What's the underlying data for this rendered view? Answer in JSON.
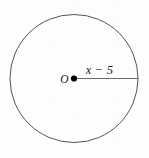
{
  "figure": {
    "kind": "geometry-diagram",
    "background_color": "#fdfdfd",
    "stroke_color": "#555555",
    "text_color": "#1b1b1b",
    "dot_color": "#000000",
    "canvas": {
      "width": 149,
      "height": 158
    },
    "circle": {
      "center_x": 74,
      "center_y": 78.5,
      "radius": 64,
      "stroke_width": 1
    },
    "center_point": {
      "label": "O",
      "x": 74,
      "y": 78.5,
      "dot_radius": 3.1
    },
    "radius_segment": {
      "label": "x − 5",
      "from_x": 74,
      "from_y": 78.5,
      "to_x": 138,
      "to_y": 78.5,
      "stroke_width": 0.9,
      "label_x": 99,
      "label_y": 73
    },
    "tick_marks": {
      "visible": false
    }
  }
}
